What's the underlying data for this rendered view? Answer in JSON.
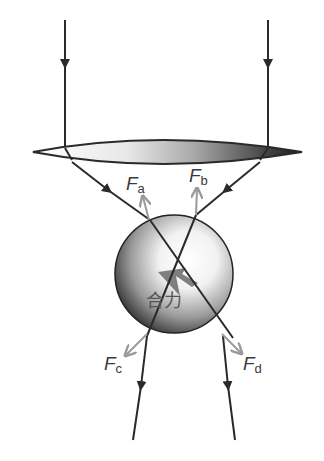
{
  "diagram": {
    "type": "optical tweezers force diagram",
    "elements": {
      "incident_rays": 2,
      "lens": "converging lens (gradient shaded)",
      "sphere": "dielectric particle (shaded sphere)",
      "refracted_rays": 2
    },
    "labels": {
      "fa": {
        "main": "F",
        "sub": "a"
      },
      "fb": {
        "main": "F",
        "sub": "b"
      },
      "fc": {
        "main": "F",
        "sub": "c"
      },
      "fd": {
        "main": "F",
        "sub": "d"
      },
      "resultant": "合力"
    },
    "colors": {
      "ray": "#2a2a2a",
      "force_arrow": "#9a9a9a",
      "label": "#3a3a3a",
      "resultant_arrow": "#6a6a6a"
    }
  }
}
